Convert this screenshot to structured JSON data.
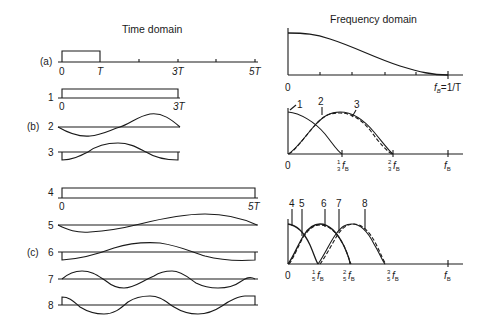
{
  "titles": {
    "time": "Time domain",
    "frequency": "Frequency domain"
  },
  "panels": {
    "a": {
      "label": "(a)"
    },
    "b": {
      "label": "(b)"
    },
    "c": {
      "label": "(c)"
    }
  },
  "time_domain": {
    "a": {
      "ticks": [
        "0",
        "T",
        "3T",
        "5T"
      ]
    },
    "b": {
      "rows": [
        {
          "id": "1",
          "ticks": [
            "0",
            "3T"
          ]
        },
        {
          "id": "2"
        },
        {
          "id": "3"
        }
      ]
    },
    "c": {
      "rows": [
        {
          "id": "4",
          "ticks": [
            "0",
            "5T"
          ]
        },
        {
          "id": "5"
        },
        {
          "id": "6"
        },
        {
          "id": "7"
        },
        {
          "id": "8"
        }
      ]
    }
  },
  "frequency_domain": {
    "a": {
      "ticks": {
        "origin": "0",
        "end": "f",
        "end_sub": "B",
        "end_suffix": "=1/T"
      }
    },
    "b": {
      "curve_labels": [
        "1",
        "2",
        "3"
      ],
      "ticks": {
        "origin": "0",
        "t1_num": "1",
        "t1_den": "3",
        "t2_num": "2",
        "t2_den": "3",
        "f": "f",
        "sub": "B"
      }
    },
    "c": {
      "curve_labels": [
        "4",
        "5",
        "6",
        "7",
        "8"
      ],
      "ticks": {
        "origin": "0",
        "t1_num": "1",
        "t1_den": "5",
        "t2_num": "2",
        "t2_den": "5",
        "t3_num": "3",
        "t3_den": "5",
        "f": "f",
        "sub": "B"
      }
    }
  }
}
